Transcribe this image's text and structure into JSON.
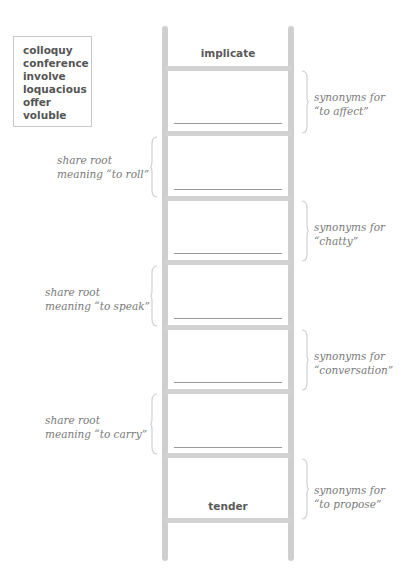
{
  "word_bank": {
    "words": [
      "colloquy",
      "conference",
      "involve",
      "loquacious",
      "offer",
      "voluble"
    ]
  },
  "ladder": {
    "top_word": "implicate",
    "bottom_word": "tender",
    "blank_count": 6,
    "rung_color": "#d2d2d2"
  },
  "clues": {
    "right": [
      {
        "line1": "synonyms for",
        "line2": "“to affect”"
      },
      {
        "line1": "synonyms for",
        "line2": "“chatty”"
      },
      {
        "line1": "synonyms for",
        "line2": "“conversation”"
      },
      {
        "line1": "synonyms for",
        "line2": "“to propose”"
      }
    ],
    "left": [
      {
        "line1": "share root",
        "line2": "meaning “to roll”"
      },
      {
        "line1": "share root",
        "line2": "meaning “to speak”"
      },
      {
        "line1": "share root",
        "line2": "meaning “to carry”"
      }
    ]
  }
}
